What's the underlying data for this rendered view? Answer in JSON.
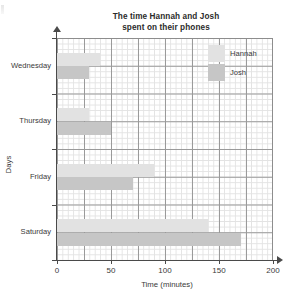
{
  "chart_data": {
    "type": "bar",
    "orientation": "horizontal",
    "title": "The time Hannah and Josh spent on their phones",
    "title_line1": "The time Hannah and Josh",
    "title_line2": "spent on their phones",
    "xlabel": "Time (minutes)",
    "ylabel": "Days",
    "categories": [
      "Wednesday",
      "Thursday",
      "Friday",
      "Saturday"
    ],
    "series": [
      {
        "name": "Hannah",
        "color": "#e2e2e2",
        "values": [
          40,
          30,
          90,
          140
        ]
      },
      {
        "name": "Josh",
        "color": "#c6c6c6",
        "values": [
          30,
          50,
          70,
          170
        ]
      }
    ],
    "xlim": [
      0,
      200
    ],
    "xticks": [
      0,
      50,
      100,
      150,
      200
    ],
    "xtick_labels": [
      "0",
      "50",
      "100",
      "150",
      "200"
    ],
    "grid": true,
    "grid_minor_step": 5,
    "grid_major_step": 25,
    "legend_position": "top-right"
  },
  "legend": {
    "entries": [
      {
        "label": "Hannah",
        "swatch": "#e2e2e2"
      },
      {
        "label": "Josh",
        "swatch": "#c6c6c6"
      }
    ]
  }
}
